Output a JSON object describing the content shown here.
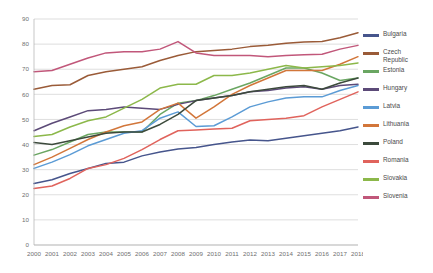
{
  "chart_data": {
    "type": "line",
    "title": "",
    "xlabel": "",
    "ylabel": "",
    "ylim": [
      0,
      90
    ],
    "ytick_step": 10,
    "yticks": [
      0,
      10,
      20,
      30,
      40,
      50,
      60,
      70,
      80,
      90
    ],
    "grid": true,
    "legend_position": "right",
    "categories": [
      "2000",
      "2001",
      "2002",
      "2003",
      "2004",
      "2005",
      "2006",
      "2007",
      "2008",
      "2009",
      "2010",
      "2011",
      "2012",
      "2013",
      "2014",
      "2015",
      "2016",
      "2017",
      "2018"
    ],
    "series": [
      {
        "name": "Bulgaria",
        "color": "#46558c",
        "values": [
          24.5,
          26.0,
          28.5,
          30.5,
          32.5,
          33.0,
          35.5,
          37.0,
          38.2,
          38.8,
          40.0,
          41.0,
          41.8,
          41.5,
          42.5,
          43.5,
          44.5,
          45.5,
          47.0
        ]
      },
      {
        "name": "Czech Republic",
        "color": "#9a5b38",
        "values": [
          62.0,
          63.5,
          63.8,
          67.5,
          69.0,
          70.0,
          71.0,
          73.5,
          75.5,
          77.0,
          77.5,
          78.0,
          79.0,
          79.5,
          80.3,
          80.8,
          81.0,
          82.5,
          84.5
        ]
      },
      {
        "name": "Estonia",
        "color": "#6aa662",
        "values": [
          35.8,
          38.0,
          41.0,
          44.0,
          45.0,
          45.0,
          45.0,
          52.0,
          56.5,
          57.5,
          59.5,
          62.0,
          64.5,
          67.5,
          70.5,
          70.5,
          68.5,
          65.5,
          66.5
        ]
      },
      {
        "name": "Hungary",
        "color": "#5c4a78",
        "values": [
          45.5,
          48.5,
          51.0,
          53.5,
          54.0,
          55.0,
          54.5,
          54.0,
          56.0,
          57.5,
          58.5,
          59.5,
          61.0,
          61.5,
          62.5,
          63.0,
          62.0,
          63.5,
          64.0
        ]
      },
      {
        "name": "Latvia",
        "color": "#5b9bd5",
        "values": [
          30.5,
          33.0,
          36.0,
          39.5,
          42.0,
          44.5,
          45.5,
          50.5,
          53.0,
          47.2,
          47.5,
          51.0,
          55.0,
          57.0,
          58.5,
          59.0,
          59.0,
          61.5,
          63.5
        ]
      },
      {
        "name": "Lithuania",
        "color": "#d2763a",
        "values": [
          32.0,
          35.0,
          38.5,
          42.0,
          45.0,
          47.5,
          49.0,
          54.0,
          56.5,
          50.5,
          55.0,
          60.0,
          63.5,
          66.5,
          69.5,
          69.5,
          69.5,
          72.0,
          75.0
        ]
      },
      {
        "name": "Poland",
        "color": "#3c4a3c",
        "values": [
          40.8,
          40.0,
          41.5,
          43.0,
          44.5,
          45.0,
          45.0,
          48.0,
          52.0,
          57.5,
          58.5,
          59.5,
          61.0,
          62.0,
          63.0,
          63.5,
          62.0,
          64.5,
          66.5
        ]
      },
      {
        "name": "Romania",
        "color": "#e0635c",
        "values": [
          22.5,
          23.5,
          26.5,
          30.5,
          32.0,
          34.5,
          38.0,
          42.0,
          45.5,
          45.8,
          46.2,
          46.5,
          49.5,
          50.0,
          50.5,
          51.5,
          55.0,
          58.0,
          61.0
        ]
      },
      {
        "name": "Slovakia",
        "color": "#8cb84a",
        "values": [
          43.2,
          44.0,
          47.0,
          49.5,
          51.0,
          54.5,
          58.0,
          62.5,
          64.0,
          64.0,
          67.5,
          67.5,
          68.5,
          70.0,
          71.5,
          70.5,
          71.0,
          71.5,
          72.5
        ]
      },
      {
        "name": "Slovenia",
        "color": "#c1577a",
        "values": [
          69.0,
          69.5,
          72.0,
          74.5,
          76.5,
          77.0,
          77.0,
          78.0,
          81.0,
          76.5,
          75.5,
          75.5,
          75.5,
          75.0,
          75.5,
          75.8,
          76.0,
          78.0,
          79.5
        ]
      }
    ]
  },
  "legend": {
    "items": [
      {
        "label": "Bulgaria"
      },
      {
        "label": "Czech\nRepublic"
      },
      {
        "label": "Estonia"
      },
      {
        "label": "Hungary"
      },
      {
        "label": "Latvia"
      },
      {
        "label": "Lithuania"
      },
      {
        "label": "Poland"
      },
      {
        "label": "Romania"
      },
      {
        "label": "Slovakia"
      },
      {
        "label": "Slovenia"
      }
    ]
  }
}
